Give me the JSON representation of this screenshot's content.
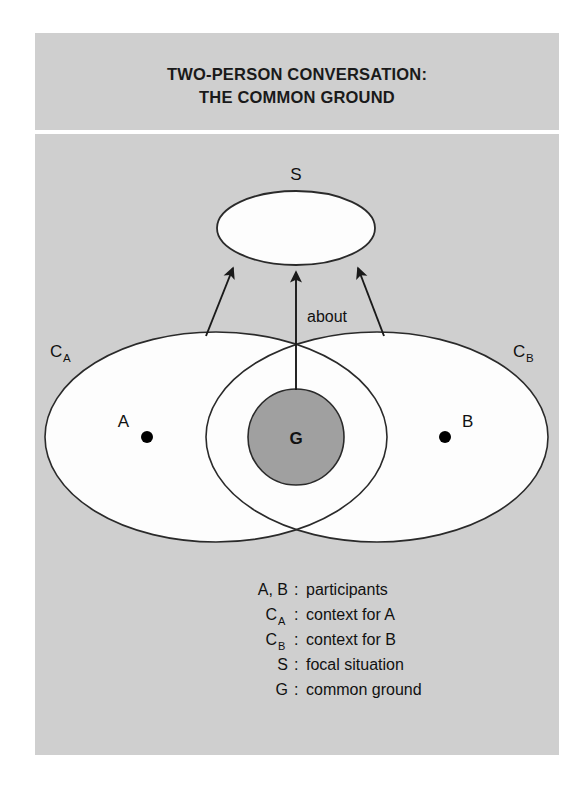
{
  "panel": {
    "background_color": "#d2d2d2",
    "divider_color": "#ffffff"
  },
  "title": {
    "line1": "TWO-PERSON CONVERSATION:",
    "line2": "THE COMMON GROUND"
  },
  "diagram": {
    "type": "venn-diagram",
    "nodes": [
      {
        "id": "S",
        "label": "S",
        "shape": "ellipse",
        "fill": "#ffffff",
        "description": "focal situation"
      },
      {
        "id": "CA",
        "label": "C",
        "sub": "A",
        "shape": "ellipse",
        "fill": "#ffffff",
        "description": "context for A"
      },
      {
        "id": "CB",
        "label": "C",
        "sub": "B",
        "shape": "ellipse",
        "fill": "#ffffff",
        "description": "context for B"
      },
      {
        "id": "G",
        "label": "G",
        "shape": "circle",
        "fill": "#a0a0a0",
        "description": "common ground"
      },
      {
        "id": "A",
        "label": "A",
        "shape": "point",
        "fill": "#000000",
        "description": "participant A"
      },
      {
        "id": "B",
        "label": "B",
        "shape": "point",
        "fill": "#000000",
        "description": "participant B"
      }
    ],
    "edges": [
      {
        "from": "CA",
        "to": "S",
        "label": ""
      },
      {
        "from": "G",
        "to": "S",
        "label": "about"
      },
      {
        "from": "CB",
        "to": "S",
        "label": ""
      }
    ],
    "edge_label": "about"
  },
  "legend": {
    "items": [
      {
        "symbol": "A, B",
        "sub": "",
        "separator": ":",
        "text": "participants"
      },
      {
        "symbol": "C",
        "sub": "A",
        "separator": ":",
        "text": "context for A"
      },
      {
        "symbol": "C",
        "sub": "B",
        "separator": ":",
        "text": "context for B"
      },
      {
        "symbol": "S",
        "sub": "",
        "separator": ":",
        "text": "focal situation"
      },
      {
        "symbol": "G",
        "sub": "",
        "separator": ":",
        "text": "common ground"
      }
    ]
  }
}
